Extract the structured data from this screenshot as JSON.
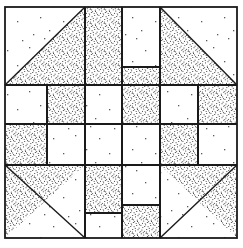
{
  "figure": {
    "name": "patchwork-quilt-block-diagram",
    "background_color": "#ffffff",
    "line_color": "#1a1a1a",
    "stipple_color": "#6e6e6e",
    "paper_fleck_color": "#555555"
  },
  "canvas": {
    "width": 243,
    "height": 248
  },
  "block": {
    "name": "pieced-square-block",
    "outer_border": {
      "x": 5,
      "y": 7,
      "width": 232,
      "height": 231,
      "stroke_width": 1.6
    },
    "grid": {
      "columns": 4,
      "rows": 4,
      "x_lines": [
        5,
        85,
        122,
        160,
        237
      ],
      "y_lines": [
        7,
        85,
        124,
        165,
        238
      ],
      "note": "Irregular 4x4 partition: wide corner bands with two narrow centre bands."
    }
  },
  "patches": [
    {
      "id": "corner-top-left",
      "name": "corner-triangle-top-left",
      "shape": "half-square-triangle",
      "fill": "stipple",
      "plain_region": "upper-left",
      "points": "5,7 85,7 85,85 5,85",
      "triangle_points": "85,7 85,85 5,85"
    },
    {
      "id": "corner-top-right",
      "name": "corner-triangle-top-right",
      "shape": "half-square-triangle",
      "fill": "stipple",
      "plain_region": "upper-right",
      "points": "160,7 237,7 237,85 160,85",
      "triangle_points": "160,7 237,85 160,85"
    },
    {
      "id": "corner-bottom-left",
      "name": "corner-triangle-bottom-left",
      "shape": "half-square-triangle",
      "fill": "stipple",
      "plain_region": "lower-left",
      "points": "5,165 85,165 85,238 5,238",
      "triangle_points": "5,165 85,165 5,238"
    },
    {
      "id": "corner-bottom-right",
      "name": "corner-triangle-bottom-right",
      "shape": "half-square-triangle",
      "fill": "stipple",
      "plain_region": "lower-right",
      "points": "160,165 237,165 237,238 160,238",
      "triangle_points": "160,165 237,165 237,238"
    },
    {
      "id": "top-left-inner-square",
      "name": "top-edge-square-stipple-left",
      "shape": "rect",
      "fill": "stipple",
      "rect": [
        85,
        7,
        37,
        78
      ]
    },
    {
      "id": "top-right-inner-square",
      "name": "top-edge-square-plain-right",
      "shape": "rect",
      "fill": "plain",
      "rect": [
        122,
        7,
        38,
        60
      ]
    },
    {
      "id": "top-center-plain",
      "name": "top-edge-square-plain-left",
      "shape": "rect",
      "fill": "plain",
      "rect": [
        85,
        85,
        37,
        39
      ]
    },
    {
      "id": "top-center-stipple",
      "name": "top-edge-square-stipple-right",
      "shape": "rect",
      "fill": "stipple",
      "rect": [
        122,
        67,
        38,
        57
      ]
    },
    {
      "id": "left-upper-plain",
      "name": "left-edge-square-plain-upper",
      "shape": "rect",
      "fill": "plain",
      "rect": [
        5,
        85,
        42,
        39
      ]
    },
    {
      "id": "left-upper-stipple",
      "name": "left-edge-square-stipple-upper",
      "shape": "rect",
      "fill": "stipple",
      "rect": [
        47,
        85,
        38,
        39
      ]
    },
    {
      "id": "left-lower-stipple",
      "name": "left-edge-square-stipple-lower",
      "shape": "rect",
      "fill": "stipple",
      "rect": [
        5,
        124,
        42,
        41
      ]
    },
    {
      "id": "left-lower-plain",
      "name": "left-edge-square-plain-lower",
      "shape": "rect",
      "fill": "plain",
      "rect": [
        47,
        124,
        38,
        41
      ]
    },
    {
      "id": "right-upper-plain",
      "name": "right-edge-square-plain-upper",
      "shape": "rect",
      "fill": "plain",
      "rect": [
        160,
        85,
        38,
        39
      ]
    },
    {
      "id": "right-upper-stipple",
      "name": "right-edge-square-stipple-upper",
      "shape": "rect",
      "fill": "stipple",
      "rect": [
        198,
        85,
        39,
        39
      ]
    },
    {
      "id": "right-lower-stipple",
      "name": "right-edge-square-stipple-lower",
      "shape": "rect",
      "fill": "stipple",
      "rect": [
        160,
        124,
        38,
        41
      ]
    },
    {
      "id": "right-lower-plain",
      "name": "right-edge-square-plain-lower",
      "shape": "rect",
      "fill": "plain",
      "rect": [
        198,
        124,
        39,
        41
      ]
    },
    {
      "id": "bottom-left-stipple",
      "name": "bottom-edge-square-stipple-left",
      "shape": "rect",
      "fill": "stipple",
      "rect": [
        85,
        165,
        37,
        48
      ]
    },
    {
      "id": "bottom-left-plain",
      "name": "bottom-edge-square-plain-left",
      "shape": "rect",
      "fill": "plain",
      "rect": [
        85,
        213,
        37,
        25
      ]
    },
    {
      "id": "bottom-right-plain",
      "name": "bottom-edge-square-plain-right",
      "shape": "rect",
      "fill": "plain",
      "rect": [
        122,
        165,
        38,
        40
      ]
    },
    {
      "id": "bottom-right-stipple",
      "name": "bottom-edge-square-stipple-right",
      "shape": "rect",
      "fill": "stipple",
      "rect": [
        122,
        205,
        38,
        33
      ]
    },
    {
      "id": "center-square",
      "name": "center-square-plain",
      "shape": "rect",
      "fill": "plain",
      "rect": [
        85,
        85,
        75,
        80
      ]
    }
  ],
  "seam_lines": [
    {
      "name": "seam-vertical-1",
      "x1": 85,
      "y1": 7,
      "x2": 85,
      "y2": 238
    },
    {
      "name": "seam-vertical-2",
      "x1": 122,
      "y1": 7,
      "x2": 122,
      "y2": 238
    },
    {
      "name": "seam-vertical-3",
      "x1": 160,
      "y1": 7,
      "x2": 160,
      "y2": 238
    },
    {
      "name": "seam-vertical-4",
      "x1": 47,
      "y1": 85,
      "x2": 47,
      "y2": 165
    },
    {
      "name": "seam-vertical-5",
      "x1": 198,
      "y1": 85,
      "x2": 198,
      "y2": 165
    },
    {
      "name": "seam-horizontal-1",
      "x1": 5,
      "y1": 85,
      "x2": 237,
      "y2": 85
    },
    {
      "name": "seam-horizontal-2",
      "x1": 5,
      "y1": 124,
      "x2": 237,
      "y2": 124
    },
    {
      "name": "seam-horizontal-3",
      "x1": 5,
      "y1": 165,
      "x2": 237,
      "y2": 165
    },
    {
      "name": "seam-horizontal-4",
      "x1": 122,
      "y1": 67,
      "x2": 160,
      "y2": 67
    },
    {
      "name": "seam-horizontal-5",
      "x1": 85,
      "y1": 213,
      "x2": 122,
      "y2": 213
    },
    {
      "name": "seam-horizontal-6",
      "x1": 122,
      "y1": 205,
      "x2": 160,
      "y2": 205
    }
  ]
}
